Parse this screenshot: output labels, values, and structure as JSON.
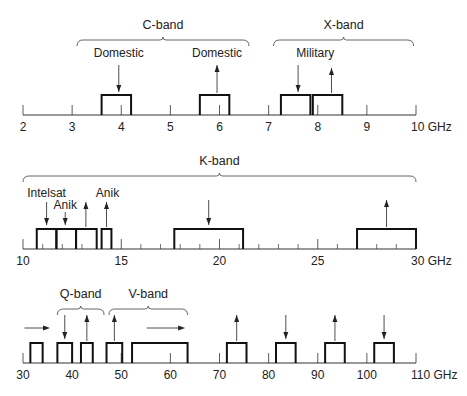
{
  "unit": "GHz",
  "rows": [
    {
      "id": "row1",
      "axis_y": 115,
      "range": [
        2,
        10
      ],
      "x_start": 23,
      "x_end": 416,
      "ticks": [
        2,
        3,
        4,
        5,
        6,
        7,
        8,
        9,
        10
      ],
      "tick_labels": [
        "2",
        "3",
        "4",
        "5",
        "6",
        "7",
        "8",
        "9",
        "10 GHz"
      ],
      "minor_ticks": [],
      "box_top": 95,
      "boxes": [
        {
          "from": 3.6,
          "to": 4.2
        },
        {
          "from": 5.6,
          "to": 6.2
        },
        {
          "from": 7.25,
          "to": 7.85
        },
        {
          "from": 7.9,
          "to": 8.5
        }
      ],
      "arrows": [
        {
          "at": 3.95,
          "dir": "down",
          "top": 65,
          "bottom": 92
        },
        {
          "at": 5.95,
          "dir": "up",
          "top": 65,
          "bottom": 93
        },
        {
          "at": 7.6,
          "dir": "down",
          "top": 65,
          "bottom": 92
        },
        {
          "at": 8.28,
          "dir": "up",
          "top": 68,
          "bottom": 93
        }
      ],
      "labels": [
        {
          "text": "Domestic",
          "at": 3.95,
          "y": 57
        },
        {
          "text": "Domestic",
          "at": 5.95,
          "y": 57
        },
        {
          "text": "Military",
          "at": 7.95,
          "y": 57
        }
      ],
      "braces": [
        {
          "label": "C-band",
          "from": 3.1,
          "to": 6.6,
          "y": 40,
          "label_y": 29
        },
        {
          "label": "X-band",
          "from": 7.1,
          "to": 9.95,
          "y": 40,
          "label_y": 29
        }
      ]
    },
    {
      "id": "row2",
      "axis_y": 249,
      "range": [
        10,
        30
      ],
      "x_start": 23,
      "x_end": 416,
      "ticks": [
        10,
        15,
        20,
        25,
        30
      ],
      "tick_labels": [
        "10",
        "15",
        "20",
        "25",
        "30 GHz"
      ],
      "minor_ticks": [
        11,
        12,
        13,
        14,
        16,
        17,
        18,
        19,
        21,
        22,
        23,
        24,
        26,
        27,
        28,
        29
      ],
      "box_top": 229,
      "boxes": [
        {
          "from": 10.7,
          "to": 11.7
        },
        {
          "from": 11.7,
          "to": 12.7
        },
        {
          "from": 12.7,
          "to": 13.75
        },
        {
          "from": 14.0,
          "to": 14.5
        },
        {
          "from": 17.7,
          "to": 21.2
        },
        {
          "from": 27.0,
          "to": 30.0
        }
      ],
      "arrows": [
        {
          "at": 11.2,
          "dir": "down",
          "top": 202,
          "bottom": 225
        },
        {
          "at": 12.15,
          "dir": "down",
          "top": 212,
          "bottom": 225
        },
        {
          "at": 13.2,
          "dir": "up",
          "top": 202,
          "bottom": 227
        },
        {
          "at": 14.25,
          "dir": "up",
          "top": 202,
          "bottom": 227
        },
        {
          "at": 19.45,
          "dir": "down",
          "top": 200,
          "bottom": 225
        },
        {
          "at": 28.5,
          "dir": "up",
          "top": 200,
          "bottom": 227
        }
      ],
      "labels": [
        {
          "text": "Intelsat",
          "at": 11.2,
          "y": 197
        },
        {
          "text": "Anik",
          "at": 12.15,
          "y": 209
        },
        {
          "text": "Anik",
          "at": 14.3,
          "y": 197
        }
      ],
      "braces": [
        {
          "label": "K-band",
          "from": 10.0,
          "to": 30.0,
          "y": 176,
          "label_y": 165
        }
      ]
    },
    {
      "id": "row3",
      "axis_y": 363,
      "range": [
        30,
        110
      ],
      "x_start": 23,
      "x_end": 416,
      "ticks": [
        30,
        40,
        50,
        60,
        70,
        80,
        90,
        100,
        110
      ],
      "tick_labels": [
        "30",
        "40",
        "50",
        "60",
        "70",
        "80",
        "90",
        "100",
        "110 GHz"
      ],
      "minor_ticks": [],
      "box_top": 343,
      "boxes": [
        {
          "from": 31.5,
          "to": 34
        },
        {
          "from": 37,
          "to": 40
        },
        {
          "from": 41.8,
          "to": 44.2
        },
        {
          "from": 47,
          "to": 50.2
        },
        {
          "from": 52.2,
          "to": 63.5
        },
        {
          "from": 71.5,
          "to": 75.5
        },
        {
          "from": 81.5,
          "to": 85.5
        },
        {
          "from": 91.5,
          "to": 95.5
        },
        {
          "from": 101.5,
          "to": 105.5
        }
      ],
      "arrows": [
        {
          "at": 38.5,
          "dir": "down",
          "top": 315,
          "bottom": 339
        },
        {
          "at": 43,
          "dir": "up",
          "top": 315,
          "bottom": 341
        },
        {
          "at": 48.6,
          "dir": "up",
          "top": 315,
          "bottom": 341
        },
        {
          "at": 73.5,
          "dir": "up",
          "top": 315,
          "bottom": 341
        },
        {
          "at": 83.5,
          "dir": "down",
          "top": 315,
          "bottom": 339
        },
        {
          "at": 93.5,
          "dir": "up",
          "top": 315,
          "bottom": 341
        },
        {
          "at": 103.5,
          "dir": "down",
          "top": 315,
          "bottom": 339
        }
      ],
      "h_arrows": [
        {
          "from": 30.3,
          "to": 35.5,
          "y": 328
        },
        {
          "from": 55.2,
          "to": 63,
          "y": 328
        }
      ],
      "labels": [],
      "braces": [
        {
          "label": "Q-band",
          "from": 37,
          "to": 46.5,
          "y": 309,
          "label_y": 298
        },
        {
          "label": "V-band",
          "from": 47.5,
          "to": 63.5,
          "y": 309,
          "label_y": 298
        }
      ]
    }
  ],
  "colors": {
    "ink": "#222222",
    "box": "#111111",
    "axis": "#333333",
    "background": "#ffffff"
  }
}
